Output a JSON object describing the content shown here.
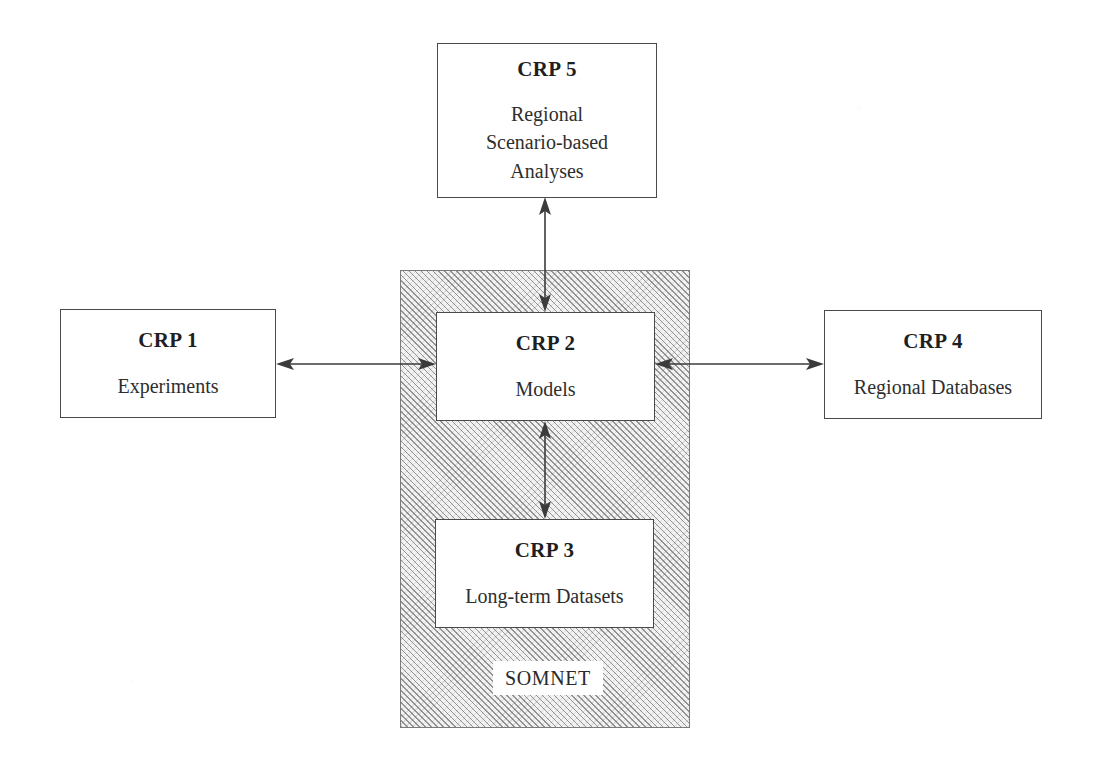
{
  "diagram": {
    "background_color": "#ffffff",
    "line_color": "#3b3b3b",
    "hatch_color": "#5a5a5a",
    "container": {
      "name": "SOMNET",
      "label": "SOMNET",
      "fill": "hatched"
    },
    "nodes": [
      {
        "id": "crp5",
        "title": "CRP 5",
        "subtitle": "Regional\nScenario-based\nAnalyses",
        "inside_container": false
      },
      {
        "id": "crp1",
        "title": "CRP 1",
        "subtitle": "Experiments",
        "inside_container": false
      },
      {
        "id": "crp2",
        "title": "CRP 2",
        "subtitle": "Models",
        "inside_container": true
      },
      {
        "id": "crp4",
        "title": "CRP 4",
        "subtitle": "Regional Databases",
        "inside_container": false
      },
      {
        "id": "crp3",
        "title": "CRP 3",
        "subtitle": "Long-term Datasets",
        "inside_container": true
      }
    ],
    "connectors": [
      {
        "id": "crp5-crp2",
        "from": "crp5",
        "to": "crp2",
        "orientation": "vertical",
        "arrowheads": "both"
      },
      {
        "id": "crp1-crp2",
        "from": "crp1",
        "to": "crp2",
        "orientation": "horizontal",
        "arrowheads": "both"
      },
      {
        "id": "crp2-crp4",
        "from": "crp2",
        "to": "crp4",
        "orientation": "horizontal",
        "arrowheads": "both"
      },
      {
        "id": "crp2-crp3",
        "from": "crp2",
        "to": "crp3",
        "orientation": "vertical",
        "arrowheads": "both"
      }
    ]
  }
}
